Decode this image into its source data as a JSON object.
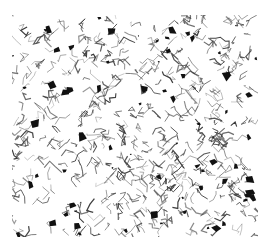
{
  "image": {
    "subject": "metallographic micrograph of grain structure",
    "description": "Black-and-white microstructure showing thin grain boundaries with scattered dark phase particles",
    "colors": {
      "background": "#ffffff",
      "boundary": "#3a3a3a",
      "particle": "#111111"
    }
  }
}
